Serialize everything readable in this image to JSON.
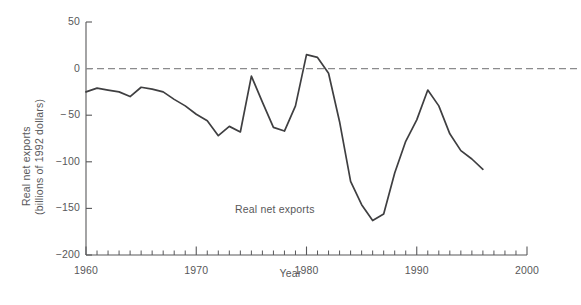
{
  "chart_data": {
    "type": "line",
    "title": "",
    "xlabel": "Year",
    "ylabel": "Real net exports (billions of 1992 dollars)",
    "ylabel_line1": "Real net exports",
    "ylabel_line2": "(billions of 1992 dollars)",
    "xlim": [
      1960,
      2000
    ],
    "ylim": [
      -200,
      50
    ],
    "grid": false,
    "legend": "none",
    "annotations": [
      {
        "text": "Real net exports",
        "x": 1977.5,
        "y": -152
      }
    ],
    "reference_lines": [
      {
        "value": 0,
        "style": "dashed",
        "color": "#8b8b8d",
        "axis": "y"
      }
    ],
    "yticks": [
      50,
      0,
      -50,
      -100,
      -150,
      -200
    ],
    "ytick_labels": [
      "50",
      "0",
      "− 50",
      "−100",
      "−150",
      "−200"
    ],
    "xticks": [
      1960,
      1970,
      1980,
      1990,
      2000
    ],
    "xtick_labels": [
      "1960",
      "1970",
      "1980",
      "1990",
      "2000"
    ],
    "xminor_tick_interval": 1,
    "line_color": "#3f3f41",
    "series": [
      {
        "name": "Real net exports",
        "x": [
          1960,
          1961,
          1962,
          1963,
          1964,
          1965,
          1966,
          1967,
          1968,
          1969,
          1970,
          1971,
          1972,
          1973,
          1974,
          1975,
          1976,
          1977,
          1978,
          1979,
          1980,
          1981,
          1982,
          1983,
          1984,
          1985,
          1986,
          1987,
          1988,
          1989,
          1990,
          1991,
          1992,
          1993,
          1994,
          1995,
          1996
        ],
        "values": [
          -25,
          -21,
          -23,
          -25,
          -30,
          -20,
          -22,
          -25,
          -33,
          -40,
          -49,
          -56,
          -72,
          -62,
          -68,
          -8,
          -36,
          -63,
          -67,
          -40,
          15,
          12,
          -5,
          -57,
          -121,
          -146,
          -163,
          -156,
          -112,
          -78,
          -55,
          -23,
          -40,
          -70,
          -88,
          -97,
          -108
        ]
      }
    ]
  },
  "caption": {
    "text": ""
  }
}
